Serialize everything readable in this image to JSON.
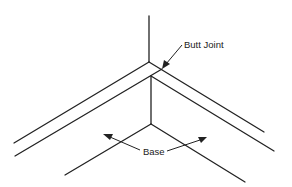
{
  "diagram": {
    "type": "corner butt joint illustration",
    "labels": {
      "butt_joint": "Butt Joint",
      "base": "Base"
    },
    "colors": {
      "line": "#222222",
      "background": "#ffffff"
    }
  }
}
